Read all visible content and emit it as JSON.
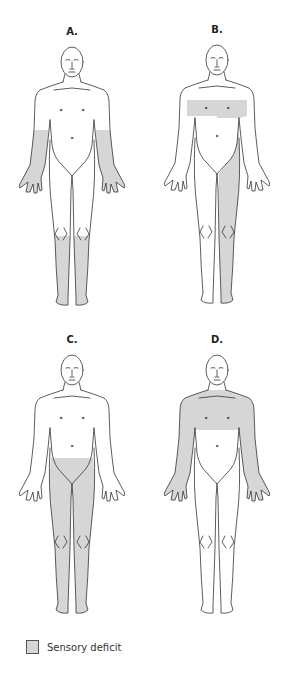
{
  "figure": {
    "panels": [
      {
        "id": "A",
        "label": "A.",
        "deficit_regions": [
          "both forearms and hands",
          "both lower legs and feet (below knees)"
        ]
      },
      {
        "id": "B",
        "label": "B.",
        "deficit_regions": [
          "chest band at nipple level (both sides)",
          "left side of trunk below chest",
          "entire left leg"
        ]
      },
      {
        "id": "C",
        "label": "C.",
        "deficit_regions": [
          "both legs from groin/lower abdomen down"
        ]
      },
      {
        "id": "D",
        "label": "D.",
        "deficit_regions": [
          "upper chest and shoulders",
          "both arms and hands"
        ]
      }
    ],
    "legend": {
      "label": "Sensory deficit",
      "swatch_color": "#d6d6d6"
    },
    "colors": {
      "deficit_fill": "#d6d6d6",
      "outline": "#333333",
      "background": "#ffffff"
    }
  }
}
